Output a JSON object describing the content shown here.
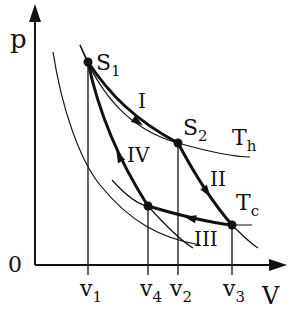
{
  "diagram": {
    "axes": {
      "y_label": "p",
      "x_label": "V",
      "origin_label": "0"
    },
    "states": [
      {
        "id": "S1",
        "label": "S",
        "sub": "1"
      },
      {
        "id": "S2",
        "label": "S",
        "sub": "2"
      }
    ],
    "isotherms": [
      {
        "label": "T",
        "sub": "h"
      },
      {
        "label": "T",
        "sub": "c"
      }
    ],
    "processes": [
      "I",
      "II",
      "III",
      "IV"
    ],
    "volume_ticks": [
      {
        "label": "v",
        "sub": "1"
      },
      {
        "label": "v",
        "sub": "4"
      },
      {
        "label": "v",
        "sub": "2"
      },
      {
        "label": "v",
        "sub": "3"
      }
    ],
    "colors": {
      "stroke": "#111111",
      "background": "#ffffff"
    }
  }
}
